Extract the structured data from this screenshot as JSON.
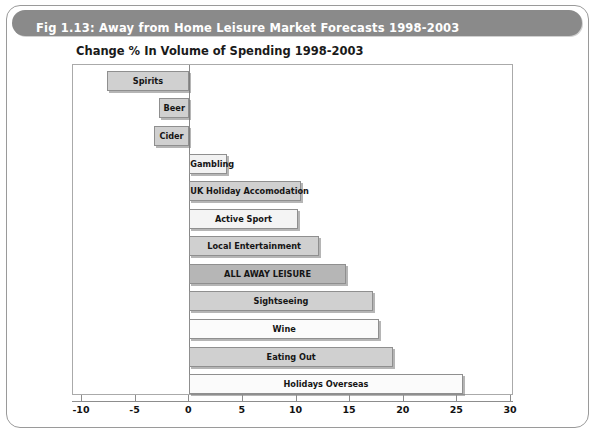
{
  "figure": {
    "banner_title": "Fig 1.13: Away from Home Leisure Market Forecasts 1998-2003",
    "banner_color": "#8a8a8a"
  },
  "chart_data": {
    "type": "bar",
    "orientation": "horizontal",
    "title": "Change % In Volume of Spending 1998-2003",
    "xlabel": "",
    "ylabel": "",
    "xlim": [
      -10,
      30
    ],
    "xticks": [
      -10,
      -5,
      0,
      5,
      10,
      15,
      20,
      25,
      30
    ],
    "xtick_labels": [
      "-10",
      "-5",
      "0",
      "5",
      "10",
      "15",
      "20",
      "25",
      "30"
    ],
    "grid": false,
    "legend": "none",
    "categories": [
      "Spirits",
      "Beer",
      "Cider",
      "Gambling",
      "UK Holiday Accomodation",
      "Active Sport",
      "Local Entertainment",
      "ALL AWAY LEISURE",
      "Sightseeing",
      "Wine",
      "Eating Out",
      "Holidays Overseas"
    ],
    "values": [
      -7.7,
      -2.8,
      -3.3,
      3.5,
      10.4,
      10.1,
      12.1,
      14.6,
      17.1,
      17.7,
      19.0,
      25.5
    ],
    "bar_fills": [
      "#d0d0d0",
      "#d0d0d0",
      "#d0d0d0",
      "#f2f2f2",
      "#d0d0d0",
      "#f4f4f4",
      "#d0d0d0",
      "#b6b6b6",
      "#d0d0d0",
      "#fbfbfb",
      "#d0d0d0",
      "#fbfbfb"
    ],
    "highlight_category": "ALL AWAY LEISURE"
  }
}
